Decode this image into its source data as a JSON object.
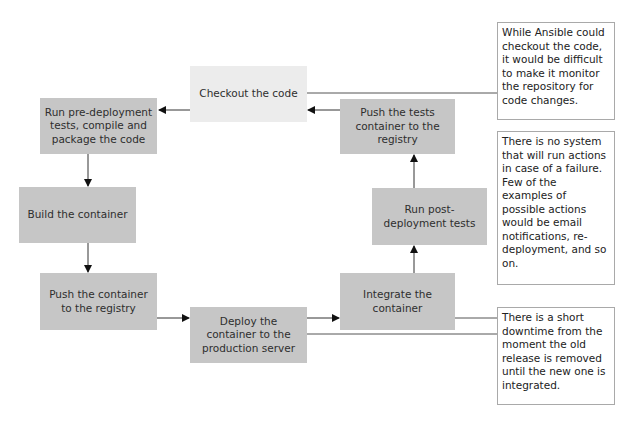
{
  "diagram": {
    "steps": [
      {
        "id": "checkout",
        "label": "Checkout the code"
      },
      {
        "id": "pre_deploy",
        "label": "Run pre-deployment tests, compile and package the code"
      },
      {
        "id": "build",
        "label": "Build the container"
      },
      {
        "id": "push_container",
        "label": "Push the container to the registry"
      },
      {
        "id": "deploy",
        "label": "Deploy the container to the production server"
      },
      {
        "id": "integrate",
        "label": "Integrate the container"
      },
      {
        "id": "post_deploy",
        "label": "Run post-deployment tests"
      },
      {
        "id": "push_tests",
        "label": "Push the tests container to the registry"
      }
    ],
    "notes": [
      {
        "id": "note_checkout",
        "text": "While Ansible could checkout the code, it would be difficult to make it monitor the repository for code changes."
      },
      {
        "id": "note_failure",
        "text": "There is no system that will run actions in case of a failure. Few of the examples of possible actions would be email notifications, re-deployment, and so on."
      },
      {
        "id": "note_downtime",
        "text": "There is a short downtime from the moment the old release is removed until the new one is integrated."
      }
    ],
    "edges": [
      {
        "from": "checkout",
        "to": "pre_deploy"
      },
      {
        "from": "pre_deploy",
        "to": "build"
      },
      {
        "from": "build",
        "to": "push_container"
      },
      {
        "from": "push_container",
        "to": "deploy"
      },
      {
        "from": "deploy",
        "to": "integrate"
      },
      {
        "from": "integrate",
        "to": "post_deploy"
      },
      {
        "from": "post_deploy",
        "to": "push_tests"
      },
      {
        "from": "push_tests",
        "to": "checkout"
      }
    ],
    "colors": {
      "box": "#c6c6c6",
      "box_light": "#ececec",
      "note_border": "#a9a9a9",
      "line": "#333333"
    }
  }
}
